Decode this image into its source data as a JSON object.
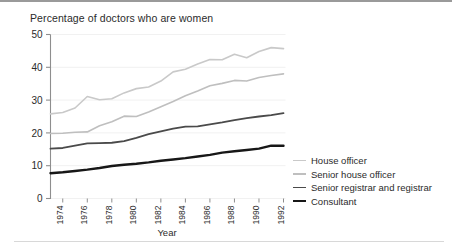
{
  "figure": {
    "title": "Percentage of doctors who are women"
  },
  "axes": {
    "x_title": "Year",
    "y_ticks": [
      "0",
      "10",
      "20",
      "30",
      "40",
      "50"
    ],
    "x_ticks": [
      "1974",
      "1976",
      "1978",
      "1980",
      "1982",
      "1984",
      "1986",
      "1988",
      "1990",
      "1992"
    ]
  },
  "legend": {
    "items": [
      {
        "label": "House officer",
        "color": "#c9c9c9",
        "width": 1.6
      },
      {
        "label": "Senior house officer",
        "color": "#bfbfbf",
        "width": 1.6
      },
      {
        "label": "Senior registrar and registrar",
        "color": "#4a4a4a",
        "width": 1.8
      },
      {
        "label": "Consultant",
        "color": "#171717",
        "width": 2.4
      }
    ]
  },
  "chart_data": {
    "type": "line",
    "title": "Percentage of doctors who are women",
    "xlabel": "Year",
    "ylabel": "",
    "xlim": [
      1973,
      1992
    ],
    "ylim": [
      0,
      50
    ],
    "grid": true,
    "legend_position": "right",
    "x": [
      1973,
      1974,
      1975,
      1976,
      1977,
      1978,
      1979,
      1980,
      1981,
      1982,
      1983,
      1984,
      1985,
      1986,
      1987,
      1988,
      1989,
      1990,
      1991,
      1992
    ],
    "series": [
      {
        "name": "House officer",
        "color": "#c9c9c9",
        "values": [
          25.8,
          26.2,
          27.6,
          31.1,
          30.1,
          30.4,
          32.2,
          33.5,
          34.0,
          35.8,
          38.6,
          39.4,
          41.0,
          42.4,
          42.3,
          44.0,
          42.9,
          44.8,
          46.0,
          45.7
        ]
      },
      {
        "name": "Senior house officer",
        "color": "#bfbfbf",
        "values": [
          19.8,
          19.9,
          20.2,
          20.3,
          22.2,
          23.4,
          25.1,
          25.0,
          26.4,
          28.0,
          29.6,
          31.3,
          32.8,
          34.4,
          35.1,
          36.0,
          35.8,
          36.9,
          37.5,
          38.0
        ]
      },
      {
        "name": "Senior registrar and registrar",
        "color": "#4a4a4a",
        "values": [
          15.2,
          15.4,
          16.1,
          16.8,
          16.9,
          17.0,
          17.5,
          18.5,
          19.6,
          20.5,
          21.3,
          21.9,
          22.0,
          22.6,
          23.2,
          23.9,
          24.5,
          25.0,
          25.4,
          26.0
        ]
      },
      {
        "name": "Consultant",
        "color": "#171717",
        "values": [
          7.7,
          8.0,
          8.4,
          8.8,
          9.3,
          9.9,
          10.3,
          10.6,
          11.0,
          11.5,
          11.9,
          12.3,
          12.8,
          13.3,
          14.0,
          14.4,
          14.8,
          15.2,
          16.1,
          16.1
        ]
      }
    ]
  }
}
